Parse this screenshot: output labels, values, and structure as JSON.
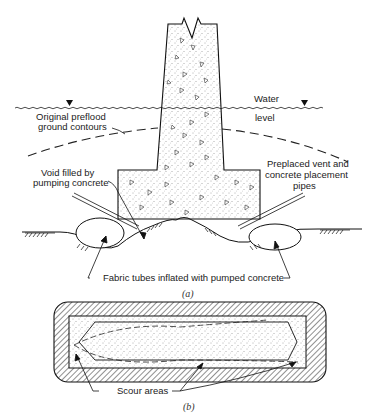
{
  "figure": {
    "part_a": {
      "caption": "(a)",
      "labels": {
        "water_1": "Water",
        "water_2": "level",
        "preflood_1": "Original preflood",
        "preflood_2": "ground contours",
        "void_1": "Void filled by",
        "void_2": "pumping concrete",
        "pipes_1": "Preplaced vent and",
        "pipes_2": "concrete placement",
        "pipes_3": "pipes",
        "tubes": "Fabric tubes inflated with pumped concrete"
      },
      "icons": [
        "water-level-triangle-icon",
        "water-level-triangle-icon"
      ]
    },
    "part_b": {
      "caption": "(b)",
      "labels": {
        "scour": "Scour areas"
      }
    },
    "colors": {
      "line": "#1a1a1a",
      "text": "#222222",
      "background": "#ffffff"
    }
  }
}
